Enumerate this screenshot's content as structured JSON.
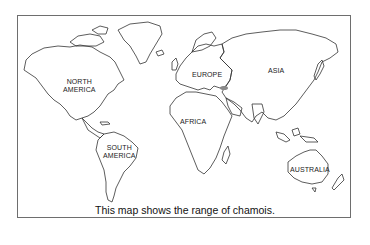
{
  "map": {
    "subject": "World map showing continents",
    "highlight_color": "#8a8a8a",
    "outline_color": "#333333",
    "highlighted_region": "chamois range (shaded area east of Europe, Caucasus)"
  },
  "labels": {
    "north_america": [
      "NORTH",
      "AMERICA"
    ],
    "south_america": [
      "SOUTH",
      "AMERICA"
    ],
    "europe": "EUROPE",
    "asia": "ASIA",
    "africa": "AFRICA",
    "australia": "AUSTRALIA"
  },
  "caption": "This map shows the range of chamois."
}
